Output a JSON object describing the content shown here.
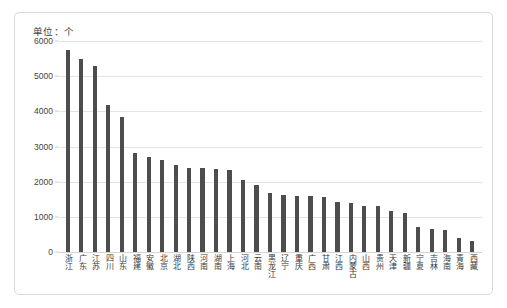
{
  "chart_data": {
    "type": "bar",
    "title": "单位：个",
    "xlabel": "",
    "ylabel": "",
    "ylim": [
      0,
      6000
    ],
    "ystep": 1000,
    "grid": true,
    "legend": false,
    "bar_color": "#4d4d4d",
    "yticks": [
      "0",
      "1000",
      "2000",
      "3000",
      "4000",
      "5000",
      "6000"
    ],
    "categories": [
      "浙江",
      "广东",
      "江苏",
      "四川",
      "山东",
      "福建",
      "安徽",
      "北京",
      "湖北",
      "陕西",
      "河南",
      "湖南",
      "上海",
      "河北",
      "云南",
      "黑龙江",
      "辽宁",
      "重庆",
      "广西",
      "甘肃",
      "江西",
      "内蒙古",
      "山西",
      "贵州",
      "天津",
      "新疆",
      "宁夏",
      "吉林",
      "海南",
      "青海",
      "西藏"
    ],
    "values": [
      5750,
      5500,
      5280,
      4180,
      3850,
      2820,
      2700,
      2620,
      2480,
      2400,
      2380,
      2350,
      2330,
      2050,
      1900,
      1680,
      1620,
      1600,
      1580,
      1560,
      1430,
      1400,
      1320,
      1300,
      1180,
      1100,
      700,
      650,
      620,
      400,
      320
    ]
  }
}
